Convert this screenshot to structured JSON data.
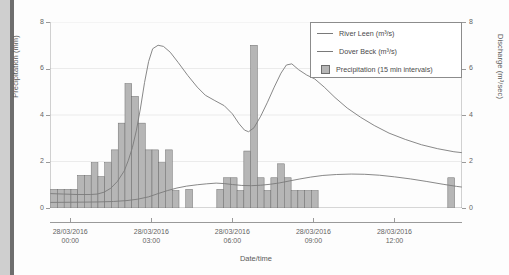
{
  "chart_data": {
    "type": "line",
    "title": "",
    "xlabel": "Date/time",
    "ylabel": "Precipitation (mm)",
    "y2label": "Discharge (m³/sec)",
    "xlim": [
      -0.75,
      14.5
    ],
    "ylim": [
      0,
      8
    ],
    "y2lim": [
      0,
      8
    ],
    "grid": true,
    "legend_position": "top-right",
    "y_ticks": [
      "0",
      "2",
      "4",
      "6",
      "8"
    ],
    "y2_ticks": [
      "0",
      "2",
      "4",
      "6",
      "8"
    ],
    "x_ticks": [
      {
        "hour": 0,
        "date": "28/03/2016",
        "time": "00:00"
      },
      {
        "hour": 3,
        "date": "28/03/2016",
        "time": "03:00"
      },
      {
        "hour": 6,
        "date": "28/03/2016",
        "time": "06:00"
      },
      {
        "hour": 9,
        "date": "28/03/2016",
        "time": "09:00"
      },
      {
        "hour": 12,
        "date": "28/03/2016",
        "time": "12:00"
      }
    ],
    "legend": [
      {
        "label": "River Leen (m³/s)",
        "marker": "line",
        "color": "#7a7a7a"
      },
      {
        "label": "Dover Beck (m³/s)",
        "marker": "line",
        "color": "#7a7a7a"
      },
      {
        "label": "Precipitation (15 min intervals)",
        "marker": "square",
        "color": "#b6b6b6"
      }
    ],
    "series": [
      {
        "name": "River Leen (m³/s)",
        "type": "line",
        "color": "#7a7a7a",
        "axis": "right",
        "points": [
          [
            -0.75,
            0.62
          ],
          [
            -0.25,
            0.6
          ],
          [
            0.25,
            0.58
          ],
          [
            0.75,
            0.58
          ],
          [
            1.0,
            0.6
          ],
          [
            1.25,
            0.68
          ],
          [
            1.5,
            0.85
          ],
          [
            1.75,
            1.15
          ],
          [
            2.0,
            1.6
          ],
          [
            2.15,
            2.05
          ],
          [
            2.3,
            2.6
          ],
          [
            2.45,
            3.35
          ],
          [
            2.6,
            4.3
          ],
          [
            2.75,
            5.4
          ],
          [
            2.9,
            6.3
          ],
          [
            3.05,
            6.85
          ],
          [
            3.25,
            7.0
          ],
          [
            3.45,
            6.95
          ],
          [
            3.7,
            6.7
          ],
          [
            4.0,
            6.25
          ],
          [
            4.35,
            5.7
          ],
          [
            4.7,
            5.2
          ],
          [
            5.0,
            4.85
          ],
          [
            5.35,
            4.62
          ],
          [
            5.7,
            4.4
          ],
          [
            6.0,
            4.05
          ],
          [
            6.25,
            3.62
          ],
          [
            6.45,
            3.35
          ],
          [
            6.6,
            3.28
          ],
          [
            6.8,
            3.45
          ],
          [
            7.05,
            3.95
          ],
          [
            7.3,
            4.55
          ],
          [
            7.55,
            5.2
          ],
          [
            7.8,
            5.8
          ],
          [
            8.0,
            6.15
          ],
          [
            8.2,
            6.2
          ],
          [
            8.45,
            5.95
          ],
          [
            8.75,
            5.72
          ],
          [
            9.05,
            5.55
          ],
          [
            9.4,
            5.2
          ],
          [
            9.8,
            4.75
          ],
          [
            10.25,
            4.3
          ],
          [
            10.75,
            3.9
          ],
          [
            11.25,
            3.55
          ],
          [
            11.8,
            3.22
          ],
          [
            12.4,
            2.95
          ],
          [
            13.0,
            2.72
          ],
          [
            13.6,
            2.55
          ],
          [
            14.2,
            2.42
          ],
          [
            14.5,
            2.38
          ]
        ]
      },
      {
        "name": "Dover Beck (m³/s)",
        "type": "line",
        "color": "#7a7a7a",
        "axis": "right",
        "points": [
          [
            -0.75,
            0.24
          ],
          [
            0.25,
            0.25
          ],
          [
            1.0,
            0.26
          ],
          [
            1.6,
            0.28
          ],
          [
            2.1,
            0.32
          ],
          [
            2.5,
            0.38
          ],
          [
            2.9,
            0.48
          ],
          [
            3.25,
            0.62
          ],
          [
            3.6,
            0.75
          ],
          [
            3.95,
            0.86
          ],
          [
            4.3,
            0.94
          ],
          [
            4.7,
            1.0
          ],
          [
            5.05,
            1.04
          ],
          [
            5.4,
            1.07
          ],
          [
            5.7,
            1.05
          ],
          [
            6.0,
            1.01
          ],
          [
            6.35,
            0.97
          ],
          [
            6.7,
            0.96
          ],
          [
            7.05,
            0.98
          ],
          [
            7.4,
            1.02
          ],
          [
            7.75,
            1.08
          ],
          [
            8.1,
            1.16
          ],
          [
            8.5,
            1.25
          ],
          [
            8.9,
            1.33
          ],
          [
            9.35,
            1.4
          ],
          [
            9.85,
            1.44
          ],
          [
            10.4,
            1.46
          ],
          [
            10.9,
            1.45
          ],
          [
            11.45,
            1.41
          ],
          [
            12.0,
            1.34
          ],
          [
            12.6,
            1.25
          ],
          [
            13.2,
            1.14
          ],
          [
            13.8,
            1.02
          ],
          [
            14.3,
            0.93
          ],
          [
            14.5,
            0.9
          ]
        ]
      },
      {
        "name": "Precipitation (15 min intervals)",
        "type": "bar",
        "color": "#b6b6b6",
        "edge": "#6d6d6d",
        "axis": "left",
        "bar_width_hours": 0.25,
        "bars": [
          [
            -0.6,
            0.8
          ],
          [
            -0.35,
            0.8
          ],
          [
            -0.1,
            0.8
          ],
          [
            0.15,
            0.8
          ],
          [
            0.4,
            1.4
          ],
          [
            0.65,
            1.4
          ],
          [
            0.9,
            1.95
          ],
          [
            1.15,
            1.35
          ],
          [
            1.4,
            1.95
          ],
          [
            1.65,
            2.5
          ],
          [
            1.9,
            3.65
          ],
          [
            2.15,
            5.35
          ],
          [
            2.4,
            4.8
          ],
          [
            2.65,
            3.65
          ],
          [
            2.9,
            2.5
          ],
          [
            3.15,
            2.5
          ],
          [
            3.4,
            1.95
          ],
          [
            3.65,
            2.5
          ],
          [
            3.9,
            0.75
          ],
          [
            4.4,
            0.8
          ],
          [
            5.55,
            0.8
          ],
          [
            5.8,
            1.3
          ],
          [
            6.05,
            1.3
          ],
          [
            6.3,
            0.75
          ],
          [
            6.55,
            2.45
          ],
          [
            6.8,
            7.0
          ],
          [
            7.05,
            1.3
          ],
          [
            7.3,
            0.75
          ],
          [
            7.55,
            1.3
          ],
          [
            7.8,
            1.9
          ],
          [
            8.05,
            1.3
          ],
          [
            8.3,
            0.75
          ],
          [
            8.55,
            0.75
          ],
          [
            8.8,
            0.75
          ],
          [
            9.05,
            0.75
          ],
          [
            14.1,
            1.3
          ]
        ]
      }
    ]
  }
}
